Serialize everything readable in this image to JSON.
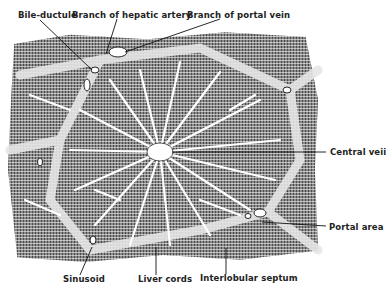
{
  "figure": {
    "labels": {
      "bile_ductule": "Bile-ductule",
      "hepatic_artery": "Branch of hepatic artery",
      "portal_vein": "Branch of portal vein",
      "central_vein": "Central veii",
      "portal_area": "Portal area",
      "sinusoid": "Sinusoid",
      "liver_cords": "Liver cords",
      "interlobular_septum": "Interlobular septum"
    },
    "colors": {
      "ink": "#222222",
      "tissue": "#8a8a8a",
      "background": "#ffffff"
    }
  }
}
